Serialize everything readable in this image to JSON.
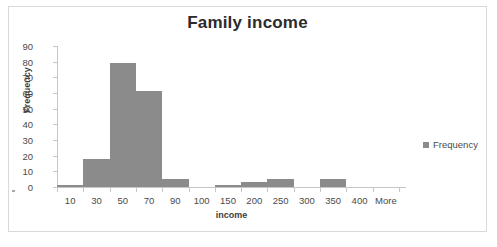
{
  "chart_data": {
    "type": "bar",
    "title": "Family income",
    "xlabel": "income",
    "ylabel": "Frequency",
    "categories": [
      "10",
      "30",
      "50",
      "70",
      "90",
      "100",
      "150",
      "200",
      "250",
      "300",
      "350",
      "400",
      "More"
    ],
    "values": [
      1.5,
      18,
      79,
      61,
      5,
      0,
      1,
      3,
      5,
      0,
      5,
      0,
      0
    ],
    "series": [
      {
        "name": "Frequency",
        "values": [
          1.5,
          18,
          79,
          61,
          5,
          0,
          1,
          3,
          5,
          0,
          5,
          0,
          0
        ]
      }
    ],
    "ylim": [
      0,
      90
    ],
    "y_ticks": [
      0,
      10,
      20,
      30,
      40,
      50,
      60,
      70,
      80,
      90
    ],
    "y_tick_labels": [
      "0",
      "10",
      "20",
      "30",
      "40",
      "50",
      "60",
      "70",
      "80",
      "90"
    ],
    "grid": false,
    "legend": [
      "Frequency"
    ],
    "legend_position": "right",
    "bar_color": "#8b8b8b",
    "axis_color": "#c6c6c6",
    "title_color": "#2b2b2b"
  },
  "legend": {
    "entries": [
      {
        "label": "Frequency",
        "color": "#8b8b8b"
      }
    ]
  }
}
